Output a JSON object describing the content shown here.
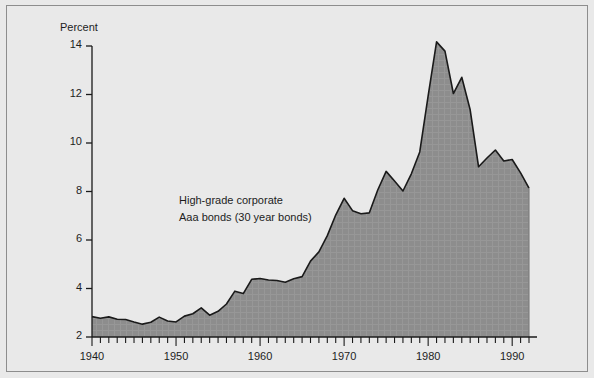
{
  "figure": {
    "background_color": "#e9e9e9",
    "frame_color": "#8d8d8d",
    "annotation_line1": "High-grade corporate",
    "annotation_line2": "Aaa  bonds (30 year bonds)"
  },
  "chart_data": {
    "type": "area",
    "title": "",
    "subtitle": "",
    "xlabel": "",
    "ylabel": "Percent",
    "ylim": [
      2,
      14
    ],
    "xlim": [
      1940,
      1992
    ],
    "grid": false,
    "legend_position": "none",
    "annotations": [
      {
        "text": "High-grade corporate\nAaa  bonds (30 year bonds)",
        "x": 1958,
        "y": 7.0
      }
    ],
    "y_ticks": [
      2,
      4,
      6,
      8,
      10,
      12,
      14
    ],
    "y_tick_labels": [
      "2",
      "4",
      "6",
      "8",
      "10",
      "12",
      "14"
    ],
    "x_ticks": [
      1940,
      1950,
      1960,
      1970,
      1980,
      1990
    ],
    "x_tick_labels": [
      "1940",
      "1950",
      "1960",
      "1970",
      "1980",
      "1990"
    ],
    "x_minor_tick_interval": 1,
    "fill_color": "#8d8d8d",
    "line_color": "#1a1a1a",
    "series": [
      {
        "name": "High-grade corporate Aaa bonds (30 year bonds)",
        "x": [
          1940,
          1941,
          1942,
          1943,
          1944,
          1945,
          1946,
          1947,
          1948,
          1949,
          1950,
          1951,
          1952,
          1953,
          1954,
          1955,
          1956,
          1957,
          1958,
          1959,
          1960,
          1961,
          1962,
          1963,
          1964,
          1965,
          1966,
          1967,
          1968,
          1969,
          1970,
          1971,
          1972,
          1973,
          1974,
          1975,
          1976,
          1977,
          1978,
          1979,
          1980,
          1981,
          1982,
          1983,
          1984,
          1985,
          1986,
          1987,
          1988,
          1989,
          1990,
          1991,
          1992
        ],
        "values": [
          2.84,
          2.77,
          2.83,
          2.73,
          2.72,
          2.62,
          2.53,
          2.61,
          2.82,
          2.66,
          2.62,
          2.86,
          2.96,
          3.2,
          2.9,
          3.06,
          3.36,
          3.89,
          3.79,
          4.38,
          4.41,
          4.35,
          4.33,
          4.26,
          4.4,
          4.49,
          5.13,
          5.51,
          6.18,
          7.03,
          7.72,
          7.21,
          7.08,
          7.12,
          8.06,
          8.83,
          8.43,
          8.02,
          8.73,
          9.63,
          11.94,
          14.17,
          13.79,
          12.04,
          12.71,
          11.37,
          9.02,
          9.38,
          9.71,
          9.26,
          9.32,
          8.77,
          8.14
        ]
      }
    ]
  }
}
